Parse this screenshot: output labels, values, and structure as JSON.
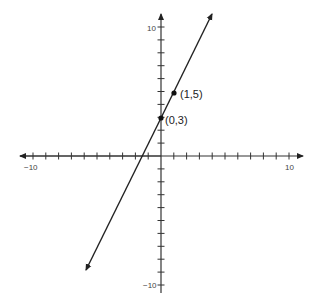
{
  "chart_data": {
    "type": "line",
    "title": "",
    "xlabel": "",
    "ylabel": "",
    "xlim": [
      -10,
      10
    ],
    "ylim": [
      -10,
      10
    ],
    "grid": false,
    "legend": null,
    "x_tick_labels": [
      "-10",
      "10"
    ],
    "y_tick_labels": [
      "10",
      "-10"
    ],
    "tick_step": 1,
    "series": [
      {
        "name": "y = 2x + 3",
        "slope": 2,
        "intercept": 3,
        "arrows": "both",
        "x": [
          -5.9,
          4.0
        ],
        "y": [
          -8.8,
          11.0
        ]
      }
    ],
    "points": [
      {
        "x": 0,
        "y": 3,
        "label": "(0,3)"
      },
      {
        "x": 1,
        "y": 5,
        "label": "(1,5)"
      }
    ],
    "colors": {
      "line": "#222222",
      "axis": "#333333",
      "text": "#444444"
    }
  },
  "labels": {
    "x_min": "−10",
    "x_max": "10",
    "y_max": "10",
    "y_min": "−10",
    "point_a": "(0,3)",
    "point_b": "(1,5)"
  }
}
